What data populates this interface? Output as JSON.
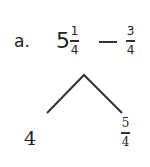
{
  "problem": {
    "label": "a.",
    "expression": {
      "whole": "5",
      "fraction1": {
        "numerator": "1",
        "denominator": "4"
      },
      "operator": "−",
      "fraction2": {
        "numerator": "3",
        "denominator": "4"
      }
    }
  },
  "decomposition": {
    "left": "4",
    "right": {
      "numerator": "5",
      "denominator": "4"
    }
  }
}
